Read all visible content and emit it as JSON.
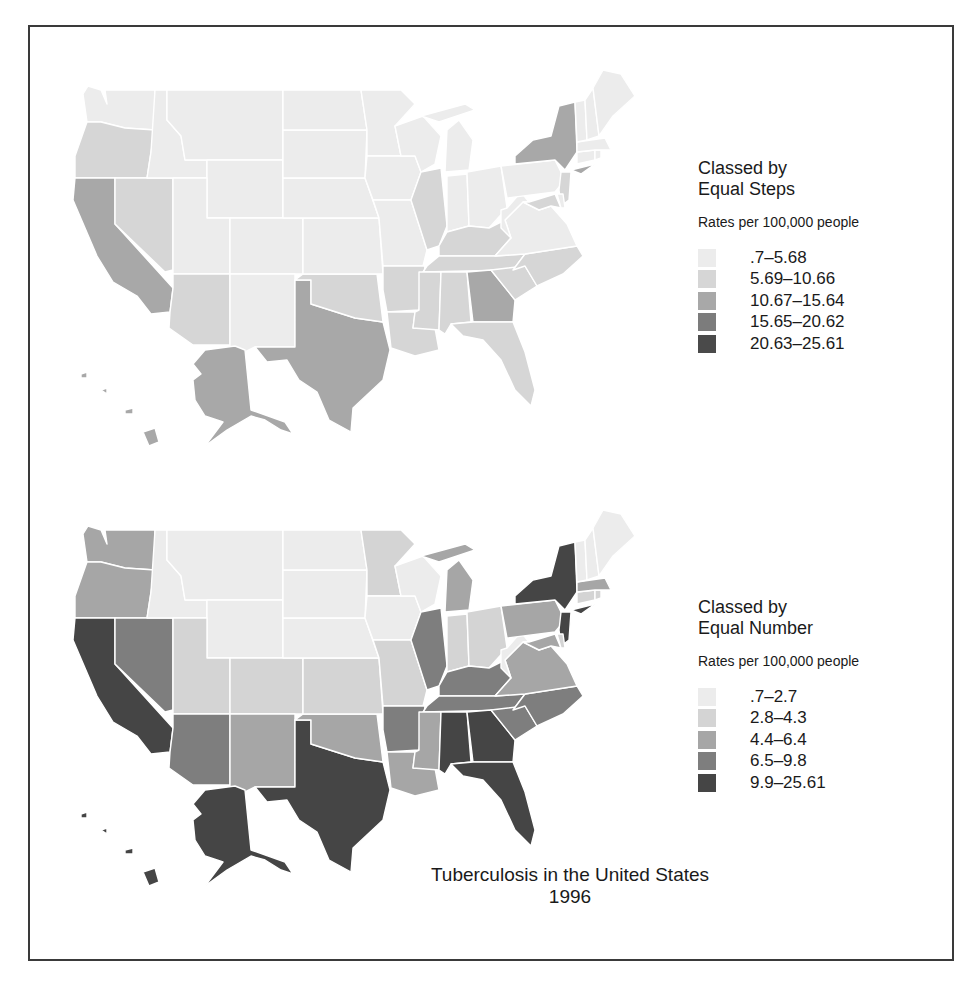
{
  "title": "Tuberculosis in the United States",
  "year": "1996",
  "maps": [
    {
      "legend_title_line1": "Classed by",
      "legend_title_line2": "Equal Steps",
      "units": "Rates per 100,000 people",
      "classes": [
        {
          "label": ".7–5.68",
          "color": "#ececec"
        },
        {
          "label": "5.69–10.66",
          "color": "#d6d6d6"
        },
        {
          "label": "10.67–15.64",
          "color": "#a8a8a8"
        },
        {
          "label": "15.65–20.62",
          "color": "#7c7c7c"
        },
        {
          "label": "20.63–25.61",
          "color": "#4a4a4a"
        }
      ]
    },
    {
      "legend_title_line1": "Classed by",
      "legend_title_line2": "Equal Number",
      "units": "Rates per 100,000 people",
      "classes": [
        {
          "label": ".7–2.7",
          "color": "#ececec"
        },
        {
          "label": "2.8–4.3",
          "color": "#d4d4d4"
        },
        {
          "label": "4.4–6.4",
          "color": "#a6a6a6"
        },
        {
          "label": "6.5–9.8",
          "color": "#7e7e7e"
        },
        {
          "label": "9.9–25.61",
          "color": "#454545"
        }
      ]
    }
  ],
  "chart_data": [
    {
      "type": "choropleth",
      "title": "Tuberculosis in the United States 1996",
      "classification": "Equal Steps",
      "units": "Rates per 100,000 people",
      "classes": [
        ".7–5.68",
        "5.69–10.66",
        "10.67–15.64",
        "15.65–20.62",
        "20.63–25.61"
      ],
      "state_class_index": {
        "WA": 0,
        "OR": 1,
        "CA": 2,
        "NV": 1,
        "ID": 0,
        "MT": 0,
        "WY": 0,
        "UT": 0,
        "CO": 0,
        "AZ": 1,
        "NM": 0,
        "TX": 2,
        "OK": 1,
        "KS": 0,
        "NE": 0,
        "SD": 0,
        "ND": 0,
        "MN": 0,
        "IA": 0,
        "MO": 0,
        "AR": 1,
        "LA": 1,
        "WI": 0,
        "IL": 1,
        "MI": 0,
        "IN": 0,
        "OH": 0,
        "KY": 1,
        "TN": 1,
        "MS": 1,
        "AL": 1,
        "GA": 2,
        "FL": 1,
        "SC": 1,
        "NC": 1,
        "VA": 0,
        "WV": 0,
        "PA": 0,
        "NY": 2,
        "NJ": 1,
        "MD": 1,
        "DE": 0,
        "CT": 0,
        "RI": 0,
        "MA": 0,
        "VT": 0,
        "NH": 0,
        "ME": 0,
        "AK": 2,
        "HI": 2
      }
    },
    {
      "type": "choropleth",
      "title": "Tuberculosis in the United States 1996",
      "classification": "Equal Number",
      "units": "Rates per 100,000 people",
      "classes": [
        ".7–2.7",
        "2.8–4.3",
        "4.4–6.4",
        "6.5–9.8",
        "9.9–25.61"
      ],
      "state_class_index": {
        "WA": 2,
        "OR": 2,
        "CA": 4,
        "NV": 3,
        "ID": 0,
        "MT": 0,
        "WY": 0,
        "UT": 1,
        "CO": 1,
        "AZ": 3,
        "NM": 2,
        "TX": 4,
        "OK": 2,
        "KS": 1,
        "NE": 0,
        "SD": 0,
        "ND": 0,
        "MN": 1,
        "IA": 0,
        "MO": 1,
        "AR": 3,
        "LA": 2,
        "WI": 0,
        "IL": 3,
        "MI": 2,
        "IN": 1,
        "OH": 1,
        "KY": 3,
        "TN": 3,
        "MS": 2,
        "AL": 4,
        "GA": 4,
        "FL": 4,
        "SC": 3,
        "NC": 3,
        "VA": 2,
        "WV": 0,
        "PA": 2,
        "NY": 4,
        "NJ": 4,
        "MD": 2,
        "DE": 1,
        "CT": 1,
        "RI": 1,
        "MA": 2,
        "VT": 0,
        "NH": 0,
        "ME": 0,
        "AK": 4,
        "HI": 4
      }
    }
  ]
}
